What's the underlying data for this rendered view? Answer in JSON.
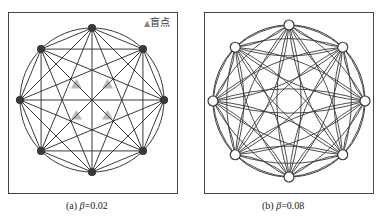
{
  "panels": [
    {
      "id": "a",
      "caption_prefix": "(a)",
      "caption_symbol": "β",
      "caption_value": "=0.02",
      "node_count": 8,
      "edge_style": "straight",
      "node_style": "filled",
      "legend": {
        "symbol": "▲",
        "label": "盲点"
      }
    },
    {
      "id": "b",
      "caption_prefix": "(b)",
      "caption_symbol": "β",
      "caption_value": "=0.08",
      "node_count": 8,
      "edge_style": "curved",
      "node_style": "hollow"
    }
  ],
  "colors": {
    "line": "#3a3a3a",
    "blind_spot": "#9a9a9a",
    "frame": "#444444"
  }
}
